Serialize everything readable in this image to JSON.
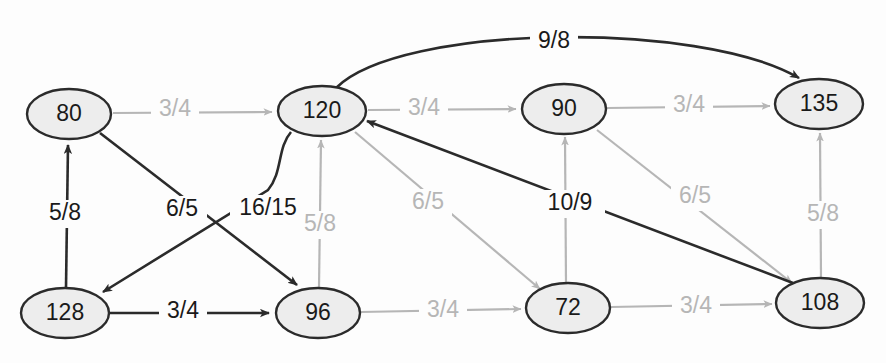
{
  "diagram": {
    "colors": {
      "node_fill": "#ededed",
      "node_stroke": "#2b2b2b",
      "edge_dark": "#2b2b2b",
      "edge_light": "#b6b6b6",
      "background": "#fdfdfd"
    },
    "nodes": [
      {
        "id": "n80",
        "label": "80",
        "cx": 69,
        "cy": 114,
        "rx": 42,
        "ry": 25
      },
      {
        "id": "n120",
        "label": "120",
        "cx": 322,
        "cy": 111,
        "rx": 44,
        "ry": 25
      },
      {
        "id": "n90",
        "label": "90",
        "cx": 564,
        "cy": 109,
        "rx": 42,
        "ry": 25
      },
      {
        "id": "n135",
        "label": "135",
        "cx": 819,
        "cy": 104,
        "rx": 44,
        "ry": 25
      },
      {
        "id": "n128",
        "label": "128",
        "cx": 65,
        "cy": 313,
        "rx": 44,
        "ry": 25
      },
      {
        "id": "n96",
        "label": "96",
        "cx": 318,
        "cy": 313,
        "rx": 42,
        "ry": 25
      },
      {
        "id": "n72",
        "label": "72",
        "cx": 568,
        "cy": 308,
        "rx": 42,
        "ry": 25
      },
      {
        "id": "n108",
        "label": "108",
        "cx": 820,
        "cy": 303,
        "rx": 44,
        "ry": 25
      }
    ],
    "edges": [
      {
        "id": "e-80-120",
        "from": "80",
        "to": "120",
        "label": "3/4",
        "color": "light",
        "label_x": 175,
        "label_y": 110
      },
      {
        "id": "e-120-90",
        "from": "120",
        "to": "90",
        "label": "3/4",
        "color": "light",
        "label_x": 424,
        "label_y": 109
      },
      {
        "id": "e-90-135",
        "from": "90",
        "to": "135",
        "label": "3/4",
        "color": "light",
        "label_x": 689,
        "label_y": 106
      },
      {
        "id": "e-120-135",
        "from": "120",
        "to": "135",
        "label": "9/8",
        "color": "dark",
        "label_x": 554,
        "label_y": 42
      },
      {
        "id": "e-128-80",
        "from": "128",
        "to": "80",
        "label": "5/8",
        "color": "dark",
        "label_x": 65,
        "label_y": 214
      },
      {
        "id": "e-80-96",
        "from": "80",
        "to": "96",
        "label": "6/5",
        "color": "dark",
        "label_x": 182,
        "label_y": 210
      },
      {
        "id": "e-120-128",
        "from": "120",
        "to": "128",
        "label": "16/15",
        "color": "dark",
        "label_x": 268,
        "label_y": 209
      },
      {
        "id": "e-96-120",
        "from": "96",
        "to": "120",
        "label": "5/8",
        "color": "light",
        "label_x": 320,
        "label_y": 225
      },
      {
        "id": "e-128-96",
        "from": "128",
        "to": "96",
        "label": "3/4",
        "color": "dark",
        "label_x": 183,
        "label_y": 312
      },
      {
        "id": "e-96-72",
        "from": "96",
        "to": "72",
        "label": "3/4",
        "color": "light",
        "label_x": 443,
        "label_y": 311
      },
      {
        "id": "e-72-108",
        "from": "72",
        "to": "108",
        "label": "3/4",
        "color": "light",
        "label_x": 696,
        "label_y": 307
      },
      {
        "id": "e-120-72",
        "from": "120",
        "to": "72",
        "label": "6/5",
        "color": "light",
        "label_x": 428,
        "label_y": 203
      },
      {
        "id": "e-108-120",
        "from": "108",
        "to": "120",
        "label": "10/9",
        "color": "dark",
        "label_x": 570,
        "label_y": 204
      },
      {
        "id": "e-72-90",
        "from": "72",
        "to": "90",
        "label": "",
        "color": "light",
        "label_x": 0,
        "label_y": 0
      },
      {
        "id": "e-90-108",
        "from": "90",
        "to": "108",
        "label": "6/5",
        "color": "light",
        "label_x": 695,
        "label_y": 197
      },
      {
        "id": "e-108-135",
        "from": "108",
        "to": "135",
        "label": "5/8",
        "color": "light",
        "label_x": 823,
        "label_y": 215
      }
    ]
  }
}
